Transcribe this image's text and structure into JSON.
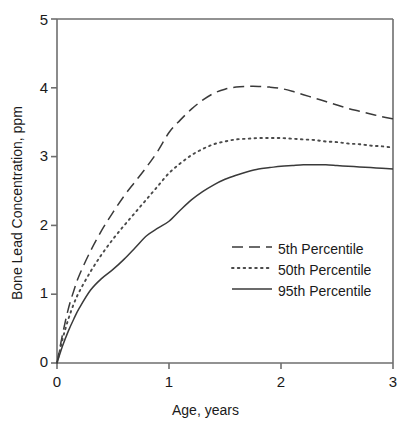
{
  "chart_data": {
    "type": "line",
    "title": "",
    "xlabel": "Age, years",
    "ylabel": "Bone Lead Concentration, ppm",
    "xlim": [
      0,
      3
    ],
    "ylim": [
      0,
      5
    ],
    "xticks": [
      "0",
      "1",
      "2",
      "3"
    ],
    "xtick_values": [
      0,
      1,
      2,
      3
    ],
    "yticks": [
      "0",
      "1",
      "2",
      "3",
      "4",
      "5"
    ],
    "ytick_values": [
      0,
      1,
      2,
      3,
      4,
      5
    ],
    "grid": false,
    "legend_position": "center-right",
    "x": [
      0,
      0.05,
      0.1,
      0.15,
      0.2,
      0.3,
      0.4,
      0.5,
      0.6,
      0.7,
      0.8,
      0.9,
      1.0,
      1.1,
      1.2,
      1.3,
      1.4,
      1.5,
      1.6,
      1.7,
      1.8,
      1.9,
      2.0,
      2.1,
      2.2,
      2.3,
      2.4,
      2.5,
      2.6,
      2.7,
      2.8,
      2.9,
      3.0
    ],
    "series": [
      {
        "name": "5th Percentile",
        "style": "dashed",
        "color": "#3a3a3a",
        "values": [
          0.0,
          0.42,
          0.78,
          1.05,
          1.28,
          1.63,
          1.93,
          2.19,
          2.43,
          2.64,
          2.85,
          3.08,
          3.35,
          3.53,
          3.69,
          3.82,
          3.92,
          3.98,
          4.01,
          4.02,
          4.02,
          4.01,
          3.99,
          3.95,
          3.9,
          3.85,
          3.8,
          3.75,
          3.7,
          3.66,
          3.62,
          3.58,
          3.55
        ]
      },
      {
        "name": "50th Percentile",
        "style": "dotted",
        "color": "#4a4a4a",
        "values": [
          0.0,
          0.35,
          0.63,
          0.86,
          1.04,
          1.33,
          1.58,
          1.8,
          2.0,
          2.19,
          2.38,
          2.57,
          2.76,
          2.9,
          3.02,
          3.11,
          3.18,
          3.22,
          3.25,
          3.26,
          3.27,
          3.27,
          3.27,
          3.26,
          3.25,
          3.24,
          3.22,
          3.21,
          3.19,
          3.18,
          3.16,
          3.15,
          3.13
        ]
      },
      {
        "name": "95th Percentile",
        "style": "solid",
        "color": "#3a3a3a",
        "values": [
          0.0,
          0.25,
          0.46,
          0.64,
          0.8,
          1.06,
          1.23,
          1.36,
          1.51,
          1.68,
          1.85,
          1.96,
          2.06,
          2.22,
          2.37,
          2.49,
          2.59,
          2.67,
          2.73,
          2.78,
          2.82,
          2.84,
          2.86,
          2.87,
          2.88,
          2.88,
          2.88,
          2.87,
          2.86,
          2.85,
          2.84,
          2.83,
          2.82
        ]
      }
    ]
  },
  "legend": {
    "items": [
      {
        "label": "5th Percentile"
      },
      {
        "label": "50th Percentile"
      },
      {
        "label": "95th Percentile"
      }
    ]
  },
  "axes": {
    "x_title": "Age, years",
    "y_title": "Bone Lead Concentration, ppm",
    "x_tick_labels": [
      "0",
      "1",
      "2",
      "3"
    ],
    "y_tick_labels": [
      "0",
      "1",
      "2",
      "3",
      "4",
      "5"
    ]
  }
}
